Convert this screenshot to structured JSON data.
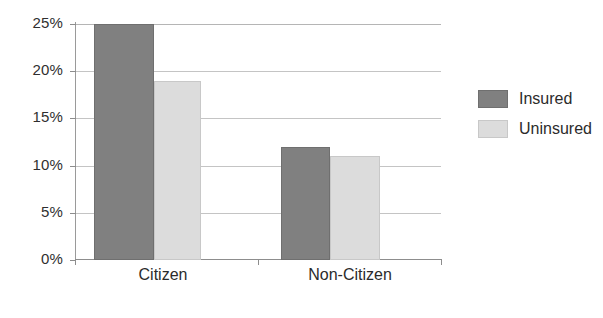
{
  "chart_data": {
    "type": "bar",
    "title": "",
    "subtitle": "",
    "xlabel": "",
    "ylabel": "",
    "categories": [
      "Citizen",
      "Non-Citizen"
    ],
    "series": [
      {
        "name": "Insured",
        "color": "#808080",
        "values": [
          25,
          19
        ]
      },
      {
        "name": "Uninsured",
        "color": "#dcdcdc",
        "values": [
          19,
          11
        ]
      }
    ],
    "values_by_group": [
      {
        "category": "Citizen",
        "Insured": 25,
        "Uninsured": 19
      },
      {
        "category": "Non-Citizen",
        "Insured": 12,
        "Uninsured": 11
      }
    ],
    "ylim": [
      0,
      25
    ],
    "ytick_values": [
      0,
      5,
      10,
      15,
      20,
      25
    ],
    "ytick_labels": [
      "0%",
      "5%",
      "10%",
      "15%",
      "20%",
      "25%"
    ],
    "grid": true,
    "grid_axis": "y",
    "legend_position": "right",
    "value_unit": "percent"
  },
  "legend": {
    "entries": [
      {
        "label": "Insured",
        "color": "#808080"
      },
      {
        "label": "Uninsured",
        "color": "#dcdcdc"
      }
    ]
  },
  "axis": {
    "yticks": [
      {
        "label": "25%",
        "value": 25
      },
      {
        "label": "20%",
        "value": 20
      },
      {
        "label": "15%",
        "value": 15
      },
      {
        "label": "10%",
        "value": 10
      },
      {
        "label": "5%",
        "value": 5
      },
      {
        "label": "0%",
        "value": 0
      }
    ],
    "categories": [
      {
        "label": "Citizen"
      },
      {
        "label": "Non-Citizen"
      }
    ]
  },
  "colors": {
    "insured": "#808080",
    "uninsured": "#dcdcdc",
    "gridline": "#c4c4c4",
    "axis": "#8d8d8d",
    "text": "#2b2b2b",
    "background": "#ffffff"
  }
}
